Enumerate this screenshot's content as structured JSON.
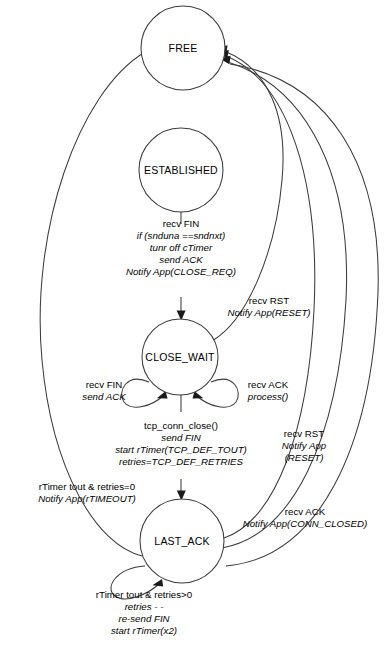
{
  "diagram": {
    "type": "state-diagram",
    "stroke_color": "#3c3c3c",
    "text_color": "#000000",
    "background_color": "#ffffff",
    "states": [
      {
        "id": "free",
        "label": "FREE",
        "cx": 183,
        "cy": 48,
        "r": 42
      },
      {
        "id": "established",
        "label": "ESTABLISHED",
        "cx": 181,
        "cy": 170,
        "r": 42
      },
      {
        "id": "close_wait",
        "label": "CLOSE_WAIT",
        "cx": 180,
        "cy": 357,
        "r": 38
      },
      {
        "id": "last_ack",
        "label": "LAST_ACK",
        "cx": 182,
        "cy": 541,
        "r": 42
      }
    ],
    "transitions": [
      {
        "id": "established-to-close-wait",
        "from": "established",
        "to": "close_wait",
        "lines": [
          {
            "text": "recv FIN",
            "italic": false
          },
          {
            "text": "if (snduna ==sndnxt)",
            "italic": true
          },
          {
            "text": "tunr off cTimer",
            "italic": true
          },
          {
            "text": "send ACK",
            "italic": true
          },
          {
            "text": "Notify App(CLOSE_REQ)",
            "italic": true
          }
        ]
      },
      {
        "id": "close-wait-to-free-rst",
        "from": "close_wait",
        "to": "free",
        "lines": [
          {
            "text": "recv RST",
            "italic": false
          },
          {
            "text": "Notify App(RESET)",
            "italic": true
          }
        ]
      },
      {
        "id": "close-wait-self-fin",
        "from": "close_wait",
        "to": "close_wait",
        "lines": [
          {
            "text": "recv FIN",
            "italic": false
          },
          {
            "text": "send ACK",
            "italic": true
          }
        ]
      },
      {
        "id": "close-wait-self-ack",
        "from": "close_wait",
        "to": "close_wait",
        "lines": [
          {
            "text": "recv ACK",
            "italic": false
          },
          {
            "text": "process()",
            "italic": true
          }
        ]
      },
      {
        "id": "close-wait-to-last-ack",
        "from": "close_wait",
        "to": "last_ack",
        "lines": [
          {
            "text": "tcp_conn_close()",
            "italic": false
          },
          {
            "text": "send FIN",
            "italic": true
          },
          {
            "text": "start rTimer(TCP_DEF_TOUT)",
            "italic": true
          },
          {
            "text": "retries=TCP_DEF_RETRIES",
            "italic": true
          }
        ]
      },
      {
        "id": "last-ack-to-free-timeout",
        "from": "last_ack",
        "to": "free",
        "lines": [
          {
            "text": "rTimer tout & retries=0",
            "italic": false
          },
          {
            "text": "Notify App(rTIMEOUT)",
            "italic": true
          }
        ]
      },
      {
        "id": "last-ack-to-free-rst",
        "from": "last_ack",
        "to": "free",
        "lines": [
          {
            "text": "recv RST",
            "italic": false
          },
          {
            "text": "Notify App",
            "italic": true
          },
          {
            "text": "(RESET)",
            "italic": true
          }
        ]
      },
      {
        "id": "last-ack-to-free-ack",
        "from": "last_ack",
        "to": "free",
        "lines": [
          {
            "text": "recv ACK",
            "italic": false
          },
          {
            "text": "Notify App(CONN_CLOSED)",
            "italic": true
          }
        ]
      },
      {
        "id": "last-ack-self-retry",
        "from": "last_ack",
        "to": "last_ack",
        "lines": [
          {
            "text": "rTimer tout & retries>0",
            "italic": false
          },
          {
            "text": "retries - -",
            "italic": true
          },
          {
            "text": "re-send FIN",
            "italic": true
          },
          {
            "text": "start rTimer(x2)",
            "italic": true
          }
        ]
      }
    ]
  }
}
